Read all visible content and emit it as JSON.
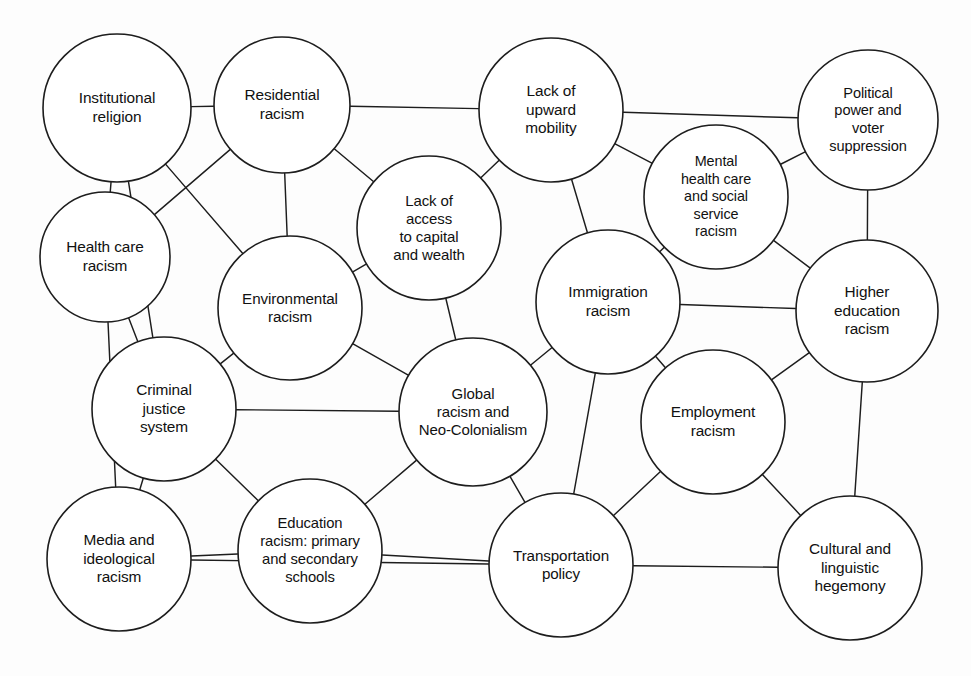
{
  "diagram": {
    "type": "node-link-network",
    "width": 971,
    "height": 676,
    "background_color": "#fdfdfd",
    "stroke_color": "#1d1d1d",
    "node_fill": "#ffffff",
    "nodes": [
      {
        "id": "institutional-religion",
        "label": "Institutional\nreligion",
        "cx": 117,
        "cy": 108,
        "r": 74,
        "font_size": 15.4
      },
      {
        "id": "residential-racism",
        "label": "Residential\nracism",
        "cx": 282,
        "cy": 105,
        "r": 68,
        "font_size": 15.4
      },
      {
        "id": "lack-of-upward-mobility",
        "label": "Lack of\nupward\nmobility",
        "cx": 551,
        "cy": 110,
        "r": 72,
        "font_size": 15.4
      },
      {
        "id": "political-power-and-voter-suppression",
        "label": "Political\npower and\nvoter\nsuppression",
        "cx": 868,
        "cy": 120,
        "r": 70,
        "font_size": 14.6
      },
      {
        "id": "health-care-racism",
        "label": "Health care\nracism",
        "cx": 105,
        "cy": 257,
        "r": 65,
        "font_size": 15.4
      },
      {
        "id": "lack-of-access-to-capital-and-wealth",
        "label": "Lack of\naccess\nto capital\nand wealth",
        "cx": 429,
        "cy": 228,
        "r": 72,
        "font_size": 15.0
      },
      {
        "id": "mental-health-care-and-social-service-racism",
        "label": "Mental\nhealth care\nand social\nservice\nracism",
        "cx": 716,
        "cy": 197,
        "r": 72,
        "font_size": 14.4
      },
      {
        "id": "environmental-racism",
        "label": "Environmental\nracism",
        "cx": 290,
        "cy": 308,
        "r": 72,
        "font_size": 15.2
      },
      {
        "id": "immigration-racism",
        "label": "Immigration\nracism",
        "cx": 608,
        "cy": 302,
        "r": 72,
        "font_size": 15.4
      },
      {
        "id": "higher-education-racism",
        "label": "Higher\neducation\nracism",
        "cx": 867,
        "cy": 311,
        "r": 71,
        "font_size": 15.4
      },
      {
        "id": "criminal-justice-system",
        "label": "Criminal\njustice\nsystem",
        "cx": 164,
        "cy": 409,
        "r": 72,
        "font_size": 15.4
      },
      {
        "id": "global-racism-and-neo-colonialism",
        "label": "Global\nracism and\nNeo-Colonialism",
        "cx": 473,
        "cy": 412,
        "r": 74,
        "font_size": 15.0
      },
      {
        "id": "employment-racism",
        "label": "Employment\nracism",
        "cx": 713,
        "cy": 422,
        "r": 72,
        "font_size": 15.4
      },
      {
        "id": "media-and-ideological-racism",
        "label": "Media and\nideological\nracism",
        "cx": 119,
        "cy": 559,
        "r": 72,
        "font_size": 15.4
      },
      {
        "id": "education-racism-primary-and-secondary-schools",
        "label": "Education\nracism: primary\nand secondary\nschools",
        "cx": 310,
        "cy": 551,
        "r": 72,
        "font_size": 14.8
      },
      {
        "id": "transportation-policy",
        "label": "Transportation\npolicy",
        "cx": 561,
        "cy": 565,
        "r": 72,
        "font_size": 15.2
      },
      {
        "id": "cultural-and-linguistic-hegemony",
        "label": "Cultural and\nlinguistic\nhegemony",
        "cx": 850,
        "cy": 568,
        "r": 72,
        "font_size": 15.4
      }
    ],
    "edges": [
      {
        "from": "institutional-religion",
        "to": "residential-racism"
      },
      {
        "from": "institutional-religion",
        "to": "health-care-racism"
      },
      {
        "from": "institutional-religion",
        "to": "environmental-racism"
      },
      {
        "from": "institutional-religion",
        "to": "criminal-justice-system"
      },
      {
        "from": "residential-racism",
        "to": "lack-of-upward-mobility"
      },
      {
        "from": "residential-racism",
        "to": "environmental-racism"
      },
      {
        "from": "residential-racism",
        "to": "lack-of-access-to-capital-and-wealth"
      },
      {
        "from": "residential-racism",
        "to": "health-care-racism"
      },
      {
        "from": "lack-of-upward-mobility",
        "to": "political-power-and-voter-suppression"
      },
      {
        "from": "lack-of-upward-mobility",
        "to": "mental-health-care-and-social-service-racism"
      },
      {
        "from": "lack-of-upward-mobility",
        "to": "lack-of-access-to-capital-and-wealth"
      },
      {
        "from": "lack-of-upward-mobility",
        "to": "immigration-racism"
      },
      {
        "from": "political-power-and-voter-suppression",
        "to": "mental-health-care-and-social-service-racism"
      },
      {
        "from": "political-power-and-voter-suppression",
        "to": "higher-education-racism"
      },
      {
        "from": "mental-health-care-and-social-service-racism",
        "to": "immigration-racism"
      },
      {
        "from": "mental-health-care-and-social-service-racism",
        "to": "higher-education-racism"
      },
      {
        "from": "lack-of-access-to-capital-and-wealth",
        "to": "environmental-racism"
      },
      {
        "from": "lack-of-access-to-capital-and-wealth",
        "to": "global-racism-and-neo-colonialism"
      },
      {
        "from": "health-care-racism",
        "to": "criminal-justice-system"
      },
      {
        "from": "health-care-racism",
        "to": "media-and-ideological-racism"
      },
      {
        "from": "environmental-racism",
        "to": "criminal-justice-system"
      },
      {
        "from": "environmental-racism",
        "to": "global-racism-and-neo-colonialism"
      },
      {
        "from": "immigration-racism",
        "to": "higher-education-racism"
      },
      {
        "from": "immigration-racism",
        "to": "global-racism-and-neo-colonialism"
      },
      {
        "from": "immigration-racism",
        "to": "employment-racism"
      },
      {
        "from": "immigration-racism",
        "to": "transportation-policy"
      },
      {
        "from": "higher-education-racism",
        "to": "employment-racism"
      },
      {
        "from": "higher-education-racism",
        "to": "cultural-and-linguistic-hegemony"
      },
      {
        "from": "criminal-justice-system",
        "to": "global-racism-and-neo-colonialism"
      },
      {
        "from": "criminal-justice-system",
        "to": "media-and-ideological-racism"
      },
      {
        "from": "criminal-justice-system",
        "to": "education-racism-primary-and-secondary-schools"
      },
      {
        "from": "global-racism-and-neo-colonialism",
        "to": "education-racism-primary-and-secondary-schools"
      },
      {
        "from": "global-racism-and-neo-colonialism",
        "to": "transportation-policy"
      },
      {
        "from": "employment-racism",
        "to": "transportation-policy"
      },
      {
        "from": "employment-racism",
        "to": "cultural-and-linguistic-hegemony"
      },
      {
        "from": "media-and-ideological-racism",
        "to": "education-racism-primary-and-secondary-schools"
      },
      {
        "from": "media-and-ideological-racism",
        "to": "transportation-policy"
      },
      {
        "from": "education-racism-primary-and-secondary-schools",
        "to": "transportation-policy"
      },
      {
        "from": "transportation-policy",
        "to": "cultural-and-linguistic-hegemony"
      }
    ]
  }
}
